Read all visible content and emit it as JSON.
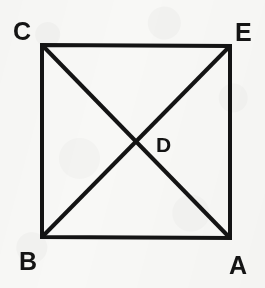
{
  "figure": {
    "kind": "geometry-diagram",
    "background_color": "#f8f8f6",
    "stroke_color": "#141414",
    "label_color": "#141414"
  },
  "shape": {
    "name": "square",
    "stroke_width": 4,
    "corners": {
      "top_left": {
        "x": 42,
        "y": 45
      },
      "top_right": {
        "x": 230,
        "y": 46
      },
      "bottom_right": {
        "x": 230,
        "y": 238
      },
      "bottom_left": {
        "x": 42,
        "y": 237
      }
    }
  },
  "diagonals": [
    {
      "name": "diagonal-C-A",
      "from": "C",
      "to": "A",
      "stroke_width": 4
    },
    {
      "name": "diagonal-B-E",
      "from": "B",
      "to": "E",
      "stroke_width": 4
    }
  ],
  "intersection": {
    "label": "D",
    "x": 136,
    "y": 142
  },
  "labels": {
    "top_left": "C",
    "top_right": "E",
    "bottom_left": "B",
    "bottom_right": "A",
    "center": "D"
  }
}
